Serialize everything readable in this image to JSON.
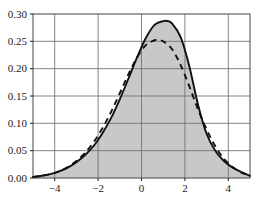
{
  "chart_data": {
    "type": "line",
    "title": "",
    "subtitle": "",
    "xlabel": "",
    "ylabel": "",
    "xlim": [
      -5,
      5
    ],
    "ylim": [
      0,
      0.3
    ],
    "grid": true,
    "legend": "none",
    "x_ticks": [
      -4,
      -2,
      0,
      2,
      4
    ],
    "x_tick_labels": [
      "-4",
      "-2",
      "0",
      "2",
      "4"
    ],
    "y_ticks": [
      0.0,
      0.05,
      0.1,
      0.15,
      0.2,
      0.25,
      0.3
    ],
    "y_tick_labels": [
      "0.00",
      "0.05",
      "0.10",
      "0.15",
      "0.20",
      "0.25",
      "0.30"
    ],
    "fill_color": "#c8c8c8",
    "curve_color": "#111111",
    "grid_color": "#6e6e78",
    "frame_color": "#55555c",
    "annotations": [],
    "series": [
      {
        "name": "solid-skewed-density",
        "style": "solid",
        "filled": true,
        "fill_color": "#c8c8c8",
        "peak_x": 1.2,
        "peak_y": 0.287,
        "x": [
          -5.0,
          -4.6,
          -4.2,
          -3.8,
          -3.4,
          -3.0,
          -2.6,
          -2.2,
          -1.8,
          -1.4,
          -1.0,
          -0.6,
          -0.2,
          0.2,
          0.6,
          1.0,
          1.2,
          1.4,
          1.8,
          2.2,
          2.6,
          3.0,
          3.4,
          3.8,
          4.2,
          4.6,
          5.0
        ],
        "y": [
          0.002,
          0.004,
          0.007,
          0.012,
          0.019,
          0.029,
          0.042,
          0.059,
          0.082,
          0.11,
          0.144,
          0.182,
          0.221,
          0.256,
          0.28,
          0.287,
          0.287,
          0.283,
          0.258,
          0.205,
          0.135,
          0.081,
          0.05,
          0.031,
          0.019,
          0.011,
          0.004
        ]
      },
      {
        "name": "dashed-normal-density",
        "style": "dashed",
        "filled": false,
        "peak_x": 0.8,
        "peak_y": 0.252,
        "x": [
          -5.0,
          -4.6,
          -4.2,
          -3.8,
          -3.4,
          -3.0,
          -2.6,
          -2.2,
          -1.8,
          -1.4,
          -1.0,
          -0.6,
          -0.2,
          0.2,
          0.6,
          0.8,
          1.0,
          1.4,
          1.8,
          2.2,
          2.6,
          3.0,
          3.4,
          3.8,
          4.2,
          4.6,
          5.0
        ],
        "y": [
          0.002,
          0.004,
          0.007,
          0.012,
          0.02,
          0.031,
          0.046,
          0.066,
          0.091,
          0.121,
          0.155,
          0.19,
          0.221,
          0.243,
          0.252,
          0.252,
          0.25,
          0.236,
          0.207,
          0.168,
          0.126,
          0.089,
          0.058,
          0.035,
          0.02,
          0.01,
          0.005
        ]
      }
    ]
  },
  "figure": {
    "width": 268,
    "height": 210,
    "background": "#ffffff",
    "plot_left": 33,
    "plot_right": 250,
    "plot_top": 14,
    "plot_bottom": 178
  }
}
